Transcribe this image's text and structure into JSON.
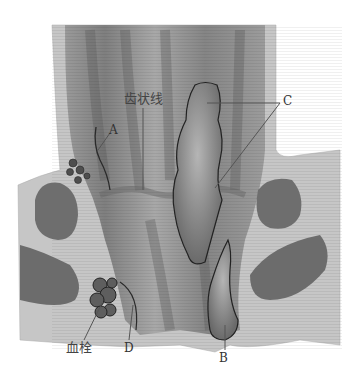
{
  "figure": {
    "labels": {
      "dentate_line": "齿状线",
      "A": "A",
      "B": "B",
      "C": "C",
      "D": "D",
      "thrombus": "血栓"
    },
    "colors": {
      "background": "#ffffff",
      "outer_tissue": "#c4c4c4",
      "lumen_dark": "#8a8a8a",
      "lumen_mid": "#a5a5a5",
      "muscle": "#6e6e6e",
      "hemorrhoid": "#7a7a7a",
      "outline": "#2a2a2a",
      "leader_line": "#555555"
    }
  }
}
